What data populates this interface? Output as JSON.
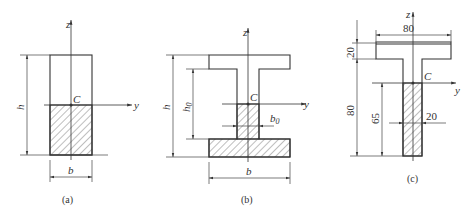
{
  "figure": {
    "panels": [
      {
        "id": "a",
        "caption": "(a)",
        "shape": "rectangle",
        "labels": {
          "z": "z",
          "y": "y",
          "centroid": "C",
          "height": "h",
          "width": "b"
        }
      },
      {
        "id": "b",
        "caption": "(b)",
        "shape": "I-section",
        "labels": {
          "z": "z",
          "y": "y",
          "centroid": "C",
          "height": "h",
          "web_height": "h0",
          "web_height_main": "h",
          "web_height_sub": "0",
          "web_width": "b0",
          "web_width_main": "b",
          "web_width_sub": "0",
          "width": "b"
        }
      },
      {
        "id": "c",
        "caption": "(c)",
        "shape": "T-section",
        "labels": {
          "z": "z",
          "y": "y",
          "centroid": "C",
          "flange_width": "80",
          "flange_thickness": "20",
          "web_height": "80",
          "centroid_to_bottom": "65",
          "web_width": "20"
        }
      }
    ]
  }
}
